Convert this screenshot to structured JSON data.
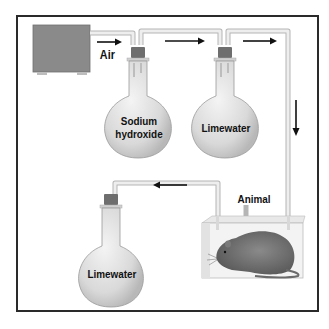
{
  "diagram": {
    "type": "apparatus",
    "labels": {
      "air": "Air",
      "flask1": "Sodium\nhydroxide",
      "flask1_line1": "Sodium",
      "flask1_line2": "hydroxide",
      "flask2": "Limewater",
      "animal": "Animal",
      "flask3": "Limewater"
    },
    "nodes": [
      {
        "id": "pump",
        "kind": "air-pump"
      },
      {
        "id": "flask1",
        "kind": "flask",
        "contents": "Sodium hydroxide"
      },
      {
        "id": "flask2",
        "kind": "flask",
        "contents": "Limewater"
      },
      {
        "id": "chamber",
        "kind": "animal-chamber",
        "contents": "Animal"
      },
      {
        "id": "flask3",
        "kind": "flask",
        "contents": "Limewater"
      }
    ],
    "flow": [
      {
        "from": "pump",
        "to": "flask1",
        "label": "Air"
      },
      {
        "from": "flask1",
        "to": "flask2"
      },
      {
        "from": "flask2",
        "to": "chamber"
      },
      {
        "from": "chamber",
        "to": "flask3"
      }
    ],
    "arrows": [
      "right",
      "right",
      "right",
      "down",
      "left"
    ],
    "colors": {
      "frame": "#2a2a2a",
      "pump": "#8a8a8a",
      "flask_glass": "#dcdcdc",
      "stopper": "#6e6e6e",
      "tube": "#e2e2e2",
      "arrow": "#111111",
      "animal": "#707070"
    }
  }
}
